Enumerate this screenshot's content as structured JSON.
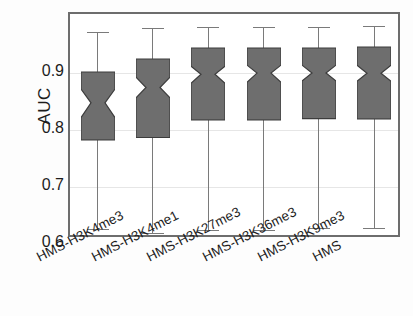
{
  "chart_data": {
    "type": "box",
    "title": "",
    "xlabel": "",
    "ylabel": "AUC",
    "ylim": [
      0.595,
      0.985
    ],
    "yticks": [
      0.6,
      0.7,
      0.8,
      0.9
    ],
    "ytick_labels": [
      "0.6",
      "0.7",
      "0.8",
      "0.9"
    ],
    "grid": true,
    "legend": "none",
    "notched": true,
    "box_fill": "#6e6e6e",
    "box_edge": "#3c3c3c",
    "whisker_color": "#7a7a7a",
    "categories": [
      "HMS-H3K4me3",
      "HMS-H3K4me1",
      "HMS-H3K27me3",
      "HMS-H3K36me3",
      "HMS-H3K9me3",
      "HMS"
    ],
    "boxes": [
      {
        "category": "HMS-H3K4me3",
        "whisker_low": 0.626,
        "q1": 0.783,
        "median": 0.848,
        "q3": 0.902,
        "whisker_high": 0.972,
        "notch_low": 0.822,
        "notch_high": 0.872
      },
      {
        "category": "HMS-H3K4me1",
        "whisker_low": 0.62,
        "q1": 0.787,
        "median": 0.875,
        "q3": 0.925,
        "whisker_high": 0.979,
        "notch_low": 0.857,
        "notch_high": 0.893
      },
      {
        "category": "HMS-H3K27me3",
        "whisker_low": 0.625,
        "q1": 0.818,
        "median": 0.898,
        "q3": 0.944,
        "whisker_high": 0.981,
        "notch_low": 0.882,
        "notch_high": 0.912
      },
      {
        "category": "HMS-H3K36me3",
        "whisker_low": 0.625,
        "q1": 0.818,
        "median": 0.9,
        "q3": 0.944,
        "whisker_high": 0.981,
        "notch_low": 0.884,
        "notch_high": 0.914
      },
      {
        "category": "HMS-H3K9me3",
        "whisker_low": 0.628,
        "q1": 0.82,
        "median": 0.9,
        "q3": 0.944,
        "whisker_high": 0.981,
        "notch_low": 0.886,
        "notch_high": 0.914
      },
      {
        "category": "HMS",
        "whisker_low": 0.628,
        "q1": 0.82,
        "median": 0.9,
        "q3": 0.946,
        "whisker_high": 0.982,
        "notch_low": 0.886,
        "notch_high": 0.914
      }
    ]
  }
}
